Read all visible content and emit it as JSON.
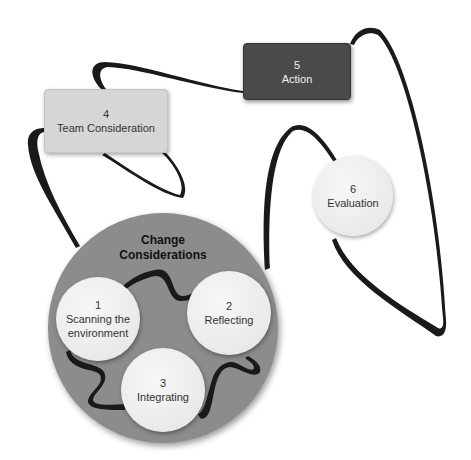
{
  "diagram": {
    "group": {
      "title_line1": "Change",
      "title_line2": "Considerations",
      "color": "#8c8c8c"
    },
    "nodes": [
      {
        "id": "1",
        "number": "1",
        "label_line1": "Scanning the",
        "label_line2": "environment",
        "shape": "circle"
      },
      {
        "id": "2",
        "number": "2",
        "label_line1": "Reflecting",
        "label_line2": "",
        "shape": "circle"
      },
      {
        "id": "3",
        "number": "3",
        "label_line1": "Integrating",
        "label_line2": "",
        "shape": "circle"
      },
      {
        "id": "4",
        "number": "4",
        "label_line1": "Team Consideration",
        "label_line2": "",
        "shape": "rounded-rect",
        "color": "#d6d6d6"
      },
      {
        "id": "5",
        "number": "5",
        "label_line1": "Action",
        "label_line2": "",
        "shape": "rounded-rect",
        "color": "#4a4a4a"
      },
      {
        "id": "6",
        "number": "6",
        "label_line1": "Evaluation",
        "label_line2": "",
        "shape": "circle"
      }
    ],
    "connections": [
      {
        "from": "1",
        "to": "2"
      },
      {
        "from": "2",
        "to": "3"
      },
      {
        "from": "3",
        "to": "1"
      },
      {
        "from": "group",
        "to": "4"
      },
      {
        "from": "4",
        "to": "5"
      },
      {
        "from": "5",
        "to": "6"
      },
      {
        "from": "6",
        "to": "group"
      }
    ]
  }
}
